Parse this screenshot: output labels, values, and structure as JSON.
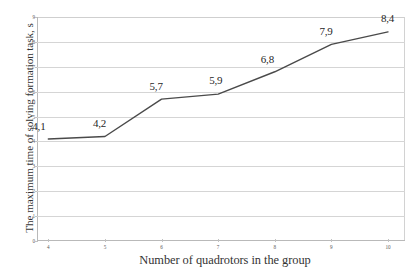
{
  "chart_data": {
    "type": "line",
    "title": "",
    "xlabel": "Number of quadrotors in the group",
    "ylabel": "The maximum time of solving formation task, s",
    "x": [
      4,
      5,
      6,
      7,
      8,
      9,
      10
    ],
    "values": [
      4.1,
      4.2,
      5.7,
      5.9,
      6.8,
      7.9,
      8.4
    ],
    "point_labels": [
      "4,1",
      "4,2",
      "5,7",
      "5,9",
      "6,8",
      "7,9",
      "8,4"
    ],
    "xtick_labels": [
      "4",
      "5",
      "6",
      "7",
      "8",
      "9",
      "10"
    ],
    "ytick_labels": [
      "0",
      "1",
      "2",
      "3",
      "4",
      "5",
      "6",
      "7",
      "8",
      "9"
    ],
    "ylim": [
      0,
      9
    ],
    "xlim": [
      3.8,
      10.3
    ],
    "grid": true,
    "legend": false,
    "series_color": "#4a4a4a",
    "grid_color": "#d5d5d5",
    "axis_color": "#b9b9b9",
    "text_color": "#333333"
  },
  "axes": {
    "y_title": "The maximum time of solving formation task, s",
    "x_title": "Number of quadrotors in the group"
  }
}
